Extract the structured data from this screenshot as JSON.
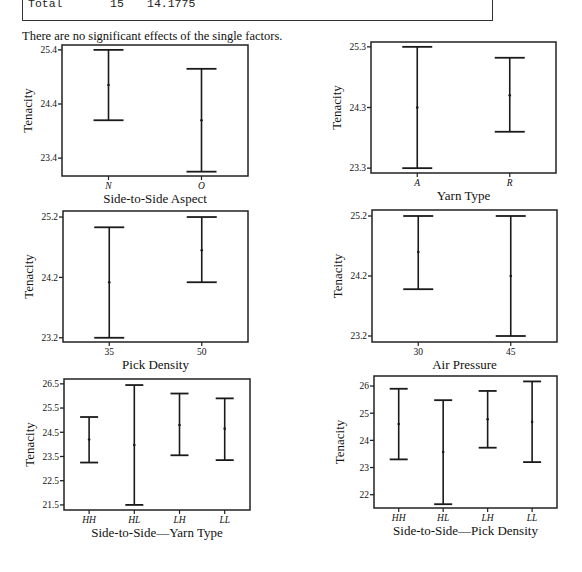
{
  "anova_table": {
    "total_row": {
      "source": "Total",
      "df": "15",
      "ss": "14.1775"
    }
  },
  "note": "There are no significant effects of the single factors.",
  "chart_data": [
    {
      "type": "errorbar",
      "id": "side-to-side-aspect",
      "xlabel": "Side-to-Side Aspect",
      "ylabel": "Tenacity",
      "categories": [
        "N",
        "O"
      ],
      "italic_categories": true,
      "yticks": [
        23.4,
        24.4,
        25.4
      ],
      "ytick_labels": [
        "23.4",
        "24.4",
        "25.4"
      ],
      "ylim": [
        23.07,
        25.49
      ],
      "series": [
        {
          "name": "Tenacity",
          "mean": [
            24.75,
            24.1
          ],
          "lower": [
            24.1,
            23.15
          ],
          "upper": [
            25.4,
            25.05
          ]
        }
      ],
      "box": {
        "x": 62,
        "y": 45,
        "w": 186,
        "h": 131
      }
    },
    {
      "type": "errorbar",
      "id": "yarn-type",
      "xlabel": "Yarn Type",
      "ylabel": "Tenacity",
      "categories": [
        "A",
        "R"
      ],
      "italic_categories": true,
      "yticks": [
        23.3,
        24.3,
        25.3
      ],
      "ytick_labels": [
        "23.3",
        "24.3",
        "25.3"
      ],
      "ylim": [
        23.22,
        25.38
      ],
      "series": [
        {
          "name": "Tenacity",
          "mean": [
            24.3,
            24.5
          ],
          "lower": [
            23.3,
            23.9
          ],
          "upper": [
            25.3,
            25.12
          ]
        }
      ],
      "box": {
        "x": 371,
        "y": 42,
        "w": 185,
        "h": 131
      }
    },
    {
      "type": "errorbar",
      "id": "pick-density",
      "xlabel": "Pick Density",
      "ylabel": "Tenacity",
      "categories": [
        "35",
        "50"
      ],
      "italic_categories": false,
      "yticks": [
        23.2,
        24.2,
        25.2
      ],
      "ytick_labels": [
        "23.2",
        "24.2",
        "25.2"
      ],
      "ylim": [
        23.13,
        25.3
      ],
      "series": [
        {
          "name": "Tenacity",
          "mean": [
            24.12,
            24.65
          ],
          "lower": [
            23.2,
            24.12
          ],
          "upper": [
            25.03,
            25.2
          ]
        }
      ],
      "box": {
        "x": 63,
        "y": 211,
        "w": 185,
        "h": 131
      }
    },
    {
      "type": "errorbar",
      "id": "air-pressure",
      "xlabel": "Air Pressure",
      "ylabel": "Tenacity",
      "categories": [
        "30",
        "45"
      ],
      "italic_categories": false,
      "yticks": [
        23.2,
        24.2,
        25.2
      ],
      "ytick_labels": [
        "23.2",
        "24.2",
        "25.2"
      ],
      "ylim": [
        23.1,
        25.3
      ],
      "series": [
        {
          "name": "Tenacity",
          "mean": [
            24.6,
            24.2
          ],
          "lower": [
            23.98,
            23.2
          ],
          "upper": [
            25.2,
            25.2
          ]
        }
      ],
      "box": {
        "x": 372,
        "y": 210,
        "w": 185,
        "h": 132
      }
    },
    {
      "type": "errorbar",
      "id": "side-to-side-yarn-type",
      "xlabel": "Side-to-Side—Yarn Type",
      "ylabel": "Tenacity",
      "categories": [
        "HH",
        "HL",
        "LH",
        "LL"
      ],
      "italic_categories": true,
      "yticks": [
        21.5,
        22.5,
        23.5,
        24.5,
        25.5,
        26.5
      ],
      "ytick_labels": [
        "21.5",
        "22.5",
        "23.5",
        "24.5",
        "25.5",
        "26.5"
      ],
      "ylim": [
        21.29,
        26.7
      ],
      "series": [
        {
          "name": "Tenacity",
          "mean": [
            24.2,
            23.97,
            24.8,
            24.65
          ],
          "lower": [
            23.25,
            21.5,
            23.55,
            23.35
          ],
          "upper": [
            25.13,
            26.45,
            26.1,
            25.9
          ]
        }
      ],
      "box": {
        "x": 64,
        "y": 379,
        "w": 186,
        "h": 131
      }
    },
    {
      "type": "errorbar",
      "id": "side-to-side-pick-density",
      "xlabel": "Side-to-Side—Pick Density",
      "ylabel": "Tenacity",
      "categories": [
        "HH",
        "HL",
        "LH",
        "LL"
      ],
      "italic_categories": true,
      "yticks": [
        22,
        23,
        24,
        25,
        26
      ],
      "ytick_labels": [
        "22",
        "23",
        "24",
        "25",
        "26"
      ],
      "ylim": [
        21.51,
        26.37
      ],
      "series": [
        {
          "name": "Tenacity",
          "mean": [
            24.6,
            23.57,
            24.78,
            24.68
          ],
          "lower": [
            23.3,
            21.65,
            23.73,
            23.2
          ],
          "upper": [
            25.9,
            25.48,
            25.82,
            26.17
          ]
        }
      ],
      "box": {
        "x": 374,
        "y": 376,
        "w": 183,
        "h": 132
      }
    }
  ]
}
